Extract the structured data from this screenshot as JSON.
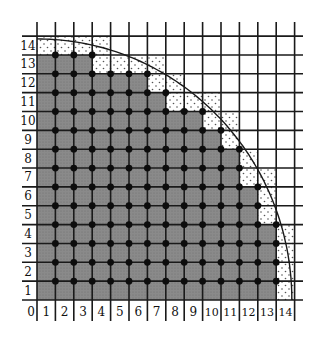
{
  "figure": {
    "radius": 14,
    "grid_max": 14,
    "x_labels": [
      "0",
      "1",
      "2",
      "3",
      "4",
      "5",
      "6",
      "7",
      "8",
      "9",
      "10",
      "11",
      "12",
      "13",
      "14"
    ],
    "y_labels": [
      "1",
      "2",
      "3",
      "4",
      "5",
      "6",
      "7",
      "8",
      "9",
      "10",
      "11",
      "12",
      "13",
      "14"
    ],
    "rows": [
      {
        "row": 14,
        "gray_to": 0,
        "stipple_to": 4
      },
      {
        "row": 13,
        "gray_to": 3,
        "stipple_to": 7
      },
      {
        "row": 12,
        "gray_to": 6,
        "stipple_to": 8
      },
      {
        "row": 11,
        "gray_to": 7,
        "stipple_to": 10
      },
      {
        "row": 10,
        "gray_to": 9,
        "stipple_to": 11
      },
      {
        "row": 9,
        "gray_to": 10,
        "stipple_to": 11
      },
      {
        "row": 8,
        "gray_to": 11,
        "stipple_to": 12
      },
      {
        "row": 7,
        "gray_to": 11,
        "stipple_to": 13
      },
      {
        "row": 6,
        "gray_to": 12,
        "stipple_to": 13
      },
      {
        "row": 5,
        "gray_to": 12,
        "stipple_to": 13
      },
      {
        "row": 4,
        "gray_to": 13,
        "stipple_to": 14
      },
      {
        "row": 3,
        "gray_to": 13,
        "stipple_to": 14
      },
      {
        "row": 2,
        "gray_to": 13,
        "stipple_to": 14
      },
      {
        "row": 1,
        "gray_to": 13,
        "stipple_to": 14
      }
    ],
    "colors": {
      "gray_fill": "#8a8a8a",
      "stipple_dot": "#555555",
      "grid_line": "#1a1a1a",
      "lattice_dot": "#0d0d0d",
      "arc": "#1a1a1a",
      "background": "#ffffff"
    }
  }
}
